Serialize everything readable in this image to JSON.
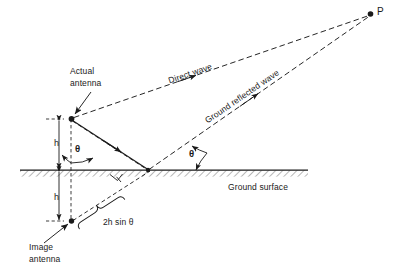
{
  "figure": {
    "type": "technical-line-diagram",
    "background_color": "#ffffff",
    "line_color": "#1a1a1a",
    "width": 394,
    "height": 280
  },
  "labels": {
    "actual_antenna": "Actual\nantenna",
    "actual_antenna_line1": "Actual",
    "actual_antenna_line2": "antenna",
    "image_antenna_line1": "Image",
    "image_antenna_line2": "antenna",
    "direct_wave": "Direct wave",
    "ground_reflected_wave": "Ground reflected wave",
    "ground_surface": "Ground surface",
    "point_p": "P",
    "height_upper": "h",
    "height_lower": "h",
    "theta_antenna": "θ",
    "theta_grazing": "θ",
    "path_difference": "2h sin θ"
  },
  "geometry": {
    "antenna_point": {
      "x": 71,
      "y": 119
    },
    "image_antenna_point": {
      "x": 71,
      "y": 221
    },
    "reflection_point": {
      "x": 148,
      "y": 170
    },
    "observation_point": {
      "x": 371,
      "y": 14
    },
    "ground_line_y": 170,
    "ground_line_x_start": 20,
    "ground_line_x_end": 308,
    "height_h": "h",
    "grazing_angle": "θ"
  },
  "colors": {
    "stroke": "#1a1a1a",
    "text": "#1a1a1a",
    "hatch": "#4d4d4d",
    "background": "#ffffff"
  },
  "icons": {
    "arrowhead": "arrowhead-icon",
    "right_angle": "right-angle-marker-icon",
    "brace": "curly-brace-icon",
    "node_dot": "node-dot-icon"
  }
}
